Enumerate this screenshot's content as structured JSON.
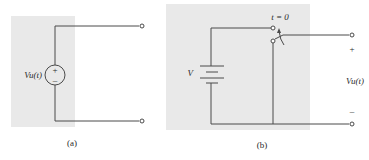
{
  "colors": {
    "panel": "#e9e9e9",
    "wire": "#4a4a4a",
    "background": "#ffffff"
  },
  "circuit_a": {
    "caption": "(a)",
    "source_label": "Vu(t)",
    "source_plus": "+",
    "source_minus": "–"
  },
  "circuit_b": {
    "caption": "(b)",
    "battery_label": "V",
    "switch_label": "t = 0",
    "output_label": "Vu(t)",
    "output_plus": "+",
    "output_minus": "–"
  }
}
